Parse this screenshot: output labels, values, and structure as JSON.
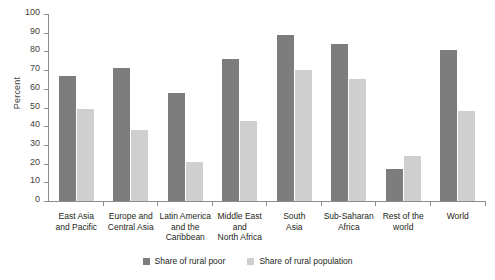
{
  "chart_data": {
    "type": "bar",
    "title": "",
    "subtitle": "",
    "xlabel": "",
    "ylabel": "Percent",
    "ylim": [
      0,
      100
    ],
    "ytick_step": 10,
    "yticks": [
      "100",
      "90",
      "80",
      "70",
      "60",
      "50",
      "40",
      "30",
      "20",
      "10",
      "0"
    ],
    "grid": false,
    "legend_position": "bottom-center",
    "categories": [
      "East Asia and Pacific",
      "Europe and Central Asia",
      "Latin America and the Caribbean",
      "Middle East and North Africa",
      "South Asia",
      "Sub-Saharan Africa",
      "Rest of the world",
      "World"
    ],
    "category_lines": [
      [
        "East Asia",
        "and Pacific"
      ],
      [
        "Europe and",
        "Central Asia"
      ],
      [
        "Latin America",
        "and the",
        "Caribbean"
      ],
      [
        "Middle East",
        "and",
        "North Africa"
      ],
      [
        "South",
        "Asia"
      ],
      [
        "Sub-Saharan",
        "Africa"
      ],
      [
        "Rest of the",
        "world"
      ],
      [
        "World"
      ]
    ],
    "series": [
      {
        "name": "Share of rural poor",
        "color": "#7d7d7d",
        "values": [
          67,
          71,
          58,
          76,
          89,
          84,
          17,
          81
        ]
      },
      {
        "name": "Share of rural population",
        "color": "#cfcfcf",
        "values": [
          49,
          38,
          21,
          43,
          70,
          65,
          24,
          48
        ]
      }
    ]
  },
  "legend": {
    "items": [
      {
        "label": "Share of rural poor",
        "color": "#7d7d7d"
      },
      {
        "label": "Share of rural population",
        "color": "#cfcfcf"
      }
    ]
  },
  "colors": {
    "axis": "#8c8c8c",
    "text": "#231f20",
    "background": "#ffffff",
    "series_dark": "#7d7d7d",
    "series_light": "#cfcfcf"
  }
}
